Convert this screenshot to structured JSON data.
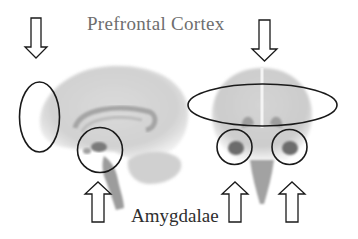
{
  "diagram": {
    "labels": {
      "prefrontal_cortex": "Prefrontal Cortex",
      "amygdalae": "Amygdalae"
    },
    "views": [
      {
        "name": "sagittal-brain-view",
        "description": "Side view of brain"
      },
      {
        "name": "coronal-brain-view",
        "description": "Front view of brain"
      }
    ],
    "markers": {
      "prefrontal_ellipses": 2,
      "amygdala_circles": 3,
      "down_arrows": 2,
      "up_arrows": 3
    },
    "colors": {
      "background": "#ffffff",
      "outline": "#1a1a1a",
      "brain_tissue": "#c8c8c8",
      "brain_dark": "#6a6a6a"
    }
  }
}
